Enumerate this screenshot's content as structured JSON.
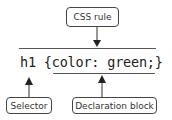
{
  "diagram": {
    "title_label": "CSS rule",
    "code": "h1 {color: green;}",
    "selector_label": "Selector",
    "declaration_label": "Declaration block",
    "colors": {
      "stroke": "#444444",
      "text": "#222222",
      "background": "#ffffff"
    }
  }
}
